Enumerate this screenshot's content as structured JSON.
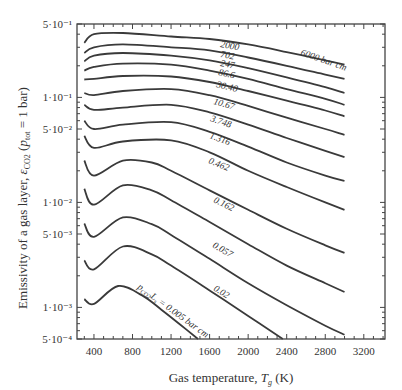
{
  "chart_data": {
    "type": "line",
    "title": "",
    "xlabel": "Gas temperature, T_g (K)",
    "ylabel": "Emissivity of a gas layer, ε_CO2 (p_tot = 1 bar)",
    "xscale": "linear",
    "yscale": "log",
    "xlim": [
      224,
      3420
    ],
    "ylim": [
      0.0005,
      0.5
    ],
    "x_ticks": [
      400,
      800,
      1200,
      1600,
      2000,
      2400,
      2800,
      3200
    ],
    "x_tick_labels": [
      "400",
      "800",
      "1200",
      "1600",
      "2000",
      "2400",
      "2800",
      "3200"
    ],
    "y_ticks": [
      0.5,
      0.1,
      0.05,
      0.01,
      0.005,
      0.001,
      0.0005
    ],
    "y_tick_labels": [
      "5·10⁻¹",
      "1·10⁻¹",
      "5·10⁻²",
      "1·10⁻²",
      "5·10⁻³",
      "1·10⁻³",
      "5·10⁻⁴"
    ],
    "grid": false,
    "legend": "inline curve labels",
    "parameter": "p_CO2·L_s (bar cm)",
    "series": [
      {
        "name": "6000 bar cm",
        "label": "6000 bar cm",
        "x": [
          300,
          400,
          700,
          1200,
          1600,
          2000,
          2400,
          2800,
          3000
        ],
        "values": [
          0.33,
          0.4,
          0.41,
          0.38,
          0.36,
          0.32,
          0.27,
          0.225,
          0.205
        ]
      },
      {
        "name": "2000",
        "label": "2000",
        "x": [
          300,
          400,
          700,
          1200,
          1600,
          2000,
          2400,
          2800,
          3000
        ],
        "values": [
          0.265,
          0.3,
          0.32,
          0.3,
          0.28,
          0.24,
          0.2,
          0.165,
          0.15
        ]
      },
      {
        "name": "702",
        "label": "702",
        "x": [
          300,
          400,
          700,
          1200,
          1600,
          2000,
          2400,
          2800,
          3000
        ],
        "values": [
          0.22,
          0.25,
          0.265,
          0.25,
          0.225,
          0.19,
          0.155,
          0.125,
          0.11
        ]
      },
      {
        "name": "247",
        "label": "247",
        "x": [
          300,
          400,
          700,
          1200,
          1600,
          2000,
          2400,
          2800,
          3000
        ],
        "values": [
          0.18,
          0.195,
          0.21,
          0.205,
          0.18,
          0.15,
          0.12,
          0.097,
          0.085
        ]
      },
      {
        "name": "86.6",
        "label": "86.6",
        "x": [
          300,
          400,
          700,
          1200,
          1600,
          2000,
          2400,
          2800,
          3000
        ],
        "values": [
          0.148,
          0.15,
          0.16,
          0.158,
          0.14,
          0.115,
          0.093,
          0.075,
          0.066
        ]
      },
      {
        "name": "30.40",
        "label": "30.40",
        "x": [
          300,
          400,
          700,
          1200,
          1600,
          2000,
          2400,
          2800,
          3000
        ],
        "values": [
          0.11,
          0.105,
          0.115,
          0.12,
          0.105,
          0.083,
          0.064,
          0.05,
          0.044
        ]
      },
      {
        "name": "10.67",
        "label": "10.67",
        "x": [
          300,
          400,
          700,
          1200,
          1600,
          2000,
          2400,
          2800,
          3000
        ],
        "values": [
          0.085,
          0.076,
          0.08,
          0.085,
          0.072,
          0.055,
          0.041,
          0.031,
          0.027
        ]
      },
      {
        "name": "3.748",
        "label": "3.748",
        "x": [
          300,
          400,
          700,
          1200,
          1600,
          2000,
          2400,
          2800,
          3000
        ],
        "values": [
          0.06,
          0.05,
          0.055,
          0.058,
          0.047,
          0.034,
          0.024,
          0.018,
          0.016
        ]
      },
      {
        "name": "1.316",
        "label": "1.316",
        "x": [
          300,
          400,
          700,
          1200,
          1600,
          2000,
          2400,
          2800,
          3000
        ],
        "values": [
          0.043,
          0.033,
          0.038,
          0.039,
          0.03,
          0.02,
          0.014,
          0.01,
          0.0085
        ]
      },
      {
        "name": "0.462",
        "label": "0.462",
        "x": [
          300,
          400,
          700,
          1000,
          1200,
          1600,
          2000,
          2400,
          2800,
          3000
        ],
        "values": [
          0.025,
          0.018,
          0.025,
          0.024,
          0.02,
          0.013,
          0.0085,
          0.0056,
          0.0039,
          0.0033
        ]
      },
      {
        "name": "0.162",
        "label": "0.162",
        "x": [
          300,
          400,
          700,
          1000,
          1200,
          1600,
          2000,
          2400,
          2800,
          3000
        ],
        "values": [
          0.0135,
          0.0095,
          0.0145,
          0.013,
          0.0105,
          0.0065,
          0.004,
          0.0025,
          0.0017,
          0.0014
        ]
      },
      {
        "name": "0.057",
        "label": "0.057",
        "x": [
          300,
          400,
          700,
          1000,
          1200,
          1600,
          2000,
          2400,
          2800,
          3000
        ],
        "values": [
          0.0063,
          0.0047,
          0.0072,
          0.0062,
          0.0049,
          0.0029,
          0.0017,
          0.00105,
          0.00067,
          0.00055
        ]
      },
      {
        "name": "0.02",
        "label": "0.02",
        "x": [
          300,
          400,
          700,
          1000,
          1200,
          1600,
          2000,
          2360
        ],
        "values": [
          0.0028,
          0.0023,
          0.0038,
          0.0032,
          0.0025,
          0.00145,
          0.00083,
          0.0005
        ]
      },
      {
        "name": "0.005 bar cm",
        "label": "p_CO2·L_s = 0.005 bar cm",
        "x": [
          300,
          400,
          650,
          900,
          1100,
          1300,
          1480
        ],
        "values": [
          0.0012,
          0.00108,
          0.0016,
          0.0013,
          0.00095,
          0.00068,
          0.0005
        ]
      }
    ]
  },
  "labels": {
    "x_axis_title_main": "Gas temperature, ",
    "x_axis_title_var": "T",
    "x_axis_title_sub": "g",
    "x_axis_title_unit": " (K)",
    "y_axis_title_main": "Emissivity of a gas layer, ",
    "y_axis_title_var": "ε",
    "y_axis_title_sub": "CO2",
    "y_axis_title_rest": " (",
    "y_axis_title_p": "p",
    "y_axis_title_psub": "tot",
    "y_axis_title_end": " = 1 bar)",
    "curve_label_bottom_prefix": "p",
    "curve_label_bottom_sub1": "CO2",
    "curve_label_bottom_L": "L",
    "curve_label_bottom_sub2": "s",
    "curve_label_bottom_suffix": " = 0.005 bar cm"
  }
}
